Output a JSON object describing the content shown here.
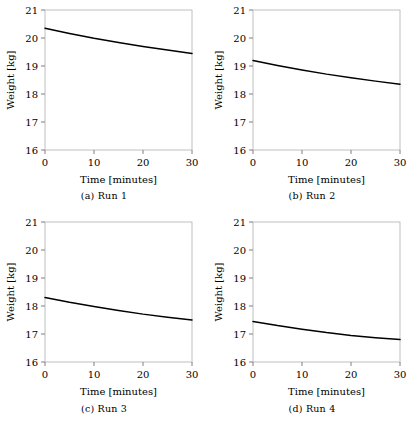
{
  "figure": {
    "panel_count": 4,
    "rows": 2,
    "cols": 2
  },
  "axes": {
    "xlabel": "Time [minutes]",
    "ylabel": "Weight [kg]",
    "xlim": [
      0,
      30
    ],
    "ylim": [
      16,
      21
    ],
    "xticks": [
      "0",
      "10",
      "20",
      "30"
    ],
    "yticks": [
      "16",
      "17",
      "18",
      "19",
      "20",
      "21"
    ],
    "xtick_values": [
      0,
      10,
      20,
      30
    ],
    "ytick_values": [
      16,
      17,
      18,
      19,
      20,
      21
    ],
    "grid": "off",
    "frame_color": "#bfbfbf",
    "line_color": "#000000",
    "tick_color": "#808080"
  },
  "captions": {
    "a": "(a)  Run 1",
    "b": "(b)  Run 2",
    "c": "(c)  Run 3",
    "d": "(d)  Run 4"
  },
  "chart_data": [
    {
      "type": "line",
      "title": "(a)  Run 1",
      "xlabel": "Time [minutes]",
      "ylabel": "Weight [kg]",
      "xlim": [
        0,
        30
      ],
      "ylim": [
        16,
        21
      ],
      "x": [
        0,
        5,
        10,
        15,
        20,
        25,
        30
      ],
      "series": [
        {
          "name": "Run 1",
          "values": [
            20.35,
            20.16,
            19.99,
            19.84,
            19.7,
            19.57,
            19.45
          ]
        }
      ],
      "legend": "none",
      "grid": "off"
    },
    {
      "type": "line",
      "title": "(b)  Run 2",
      "xlabel": "Time [minutes]",
      "ylabel": "Weight [kg]",
      "xlim": [
        0,
        30
      ],
      "ylim": [
        16,
        21
      ],
      "x": [
        0,
        5,
        10,
        15,
        20,
        25,
        30
      ],
      "series": [
        {
          "name": "Run 2",
          "values": [
            19.2,
            19.02,
            18.86,
            18.71,
            18.58,
            18.46,
            18.35
          ]
        }
      ],
      "legend": "none",
      "grid": "off"
    },
    {
      "type": "line",
      "title": "(c)  Run 3",
      "xlabel": "Time [minutes]",
      "ylabel": "Weight [kg]",
      "xlim": [
        0,
        30
      ],
      "ylim": [
        16,
        21
      ],
      "x": [
        0,
        5,
        10,
        15,
        20,
        25,
        30
      ],
      "series": [
        {
          "name": "Run 3",
          "values": [
            18.3,
            18.13,
            17.98,
            17.84,
            17.71,
            17.6,
            17.5
          ]
        }
      ],
      "legend": "none",
      "grid": "off"
    },
    {
      "type": "line",
      "title": "(d)  Run 4",
      "xlabel": "Time [minutes]",
      "ylabel": "Weight [kg]",
      "xlim": [
        0,
        30
      ],
      "ylim": [
        16,
        21
      ],
      "x": [
        0,
        5,
        10,
        15,
        20,
        25,
        30
      ],
      "series": [
        {
          "name": "Run 4",
          "values": [
            17.45,
            17.3,
            17.17,
            17.05,
            16.95,
            16.87,
            16.8
          ]
        }
      ],
      "legend": "none",
      "grid": "off"
    }
  ]
}
